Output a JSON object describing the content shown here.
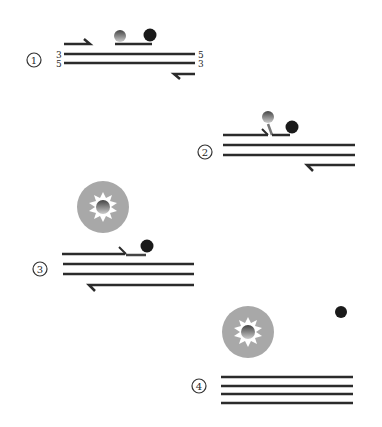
{
  "diagram": {
    "type": "TaqMan probe PCR mechanism",
    "steps": [
      {
        "number": "①",
        "label": "step-1",
        "end_labels_left": [
          "3",
          "5"
        ],
        "end_labels_right": [
          "5",
          "3"
        ],
        "description": "Primers and probe (reporter + quencher) anneal to template"
      },
      {
        "number": "②",
        "label": "step-2",
        "description": "Primer extension displaces the probe 5' end"
      },
      {
        "number": "③",
        "label": "step-3",
        "description": "Reporter cleaved and fluoresces; quencher remains"
      },
      {
        "number": "④",
        "label": "step-4",
        "description": "Extension complete; reporter and quencher released"
      }
    ],
    "colors": {
      "strand": "#2b2b2b",
      "quencher": "#1a1a1a",
      "reporter_glow": "#a8a8a8",
      "reporter_core": "#333333"
    }
  }
}
